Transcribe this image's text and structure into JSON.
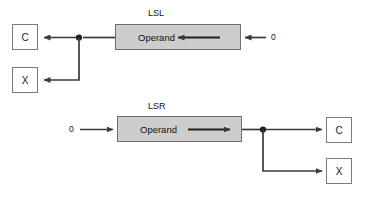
{
  "diagram": {
    "background_color": "#ffffff",
    "line_color": "#3a3a3a",
    "operand_fill": "#cdcdcd",
    "operand_border": "#6e6e6e",
    "box_border": "#7a7a7a",
    "sections": [
      {
        "id": "lsl",
        "title": "LSL",
        "operand_label": "Operand",
        "input_constant": "0",
        "output_flag_c": "C",
        "output_flag_x": "X",
        "shift_direction": "left"
      },
      {
        "id": "lsr",
        "title": "LSR",
        "operand_label": "Operand",
        "input_constant": "0",
        "output_flag_c": "C",
        "output_flag_x": "X",
        "shift_direction": "right"
      }
    ]
  }
}
